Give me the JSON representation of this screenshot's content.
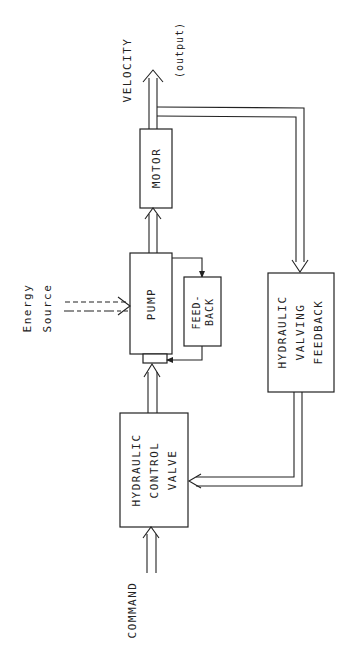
{
  "diagram": {
    "orientation": "rotated-90-ccw",
    "blocks": {
      "motor": {
        "label": "MOTOR"
      },
      "pump": {
        "label": "PUMP"
      },
      "pump_feedback": {
        "line1": "FEED-",
        "line2": "BACK"
      },
      "control_valve": {
        "line1": "HYDRAULIC",
        "line2": "CONTROL",
        "line3": "VALVE"
      },
      "valving_feedback": {
        "line1": "HYDRAULIC",
        "line2": "VALVING",
        "line3": "FEEDBACK"
      }
    },
    "labels": {
      "output_name": "VELOCITY",
      "output_note": "(output)",
      "energy_line1": "Energy",
      "energy_line2": "Source",
      "command": "COMMAND"
    },
    "connections": [
      {
        "from": "COMMAND",
        "to": "HYDRAULIC CONTROL VALVE"
      },
      {
        "from": "HYDRAULIC CONTROL VALVE",
        "to": "PUMP"
      },
      {
        "from": "Energy Source",
        "to": "PUMP",
        "style": "dashed"
      },
      {
        "from": "PUMP",
        "to": "FEED-BACK"
      },
      {
        "from": "FEED-BACK",
        "to": "PUMP"
      },
      {
        "from": "PUMP",
        "to": "MOTOR"
      },
      {
        "from": "MOTOR",
        "to": "VELOCITY (output)"
      },
      {
        "from": "MOTOR",
        "to": "HYDRAULIC VALVING FEEDBACK"
      },
      {
        "from": "HYDRAULIC VALVING FEEDBACK",
        "to": "HYDRAULIC CONTROL VALVE"
      }
    ]
  }
}
